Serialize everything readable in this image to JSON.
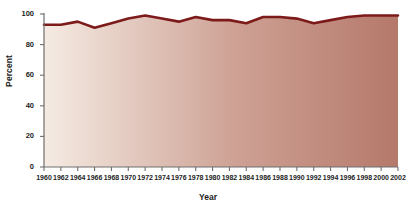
{
  "chart_data": {
    "type": "area",
    "title": "",
    "subtitle": "",
    "xlabel": "Year",
    "ylabel": "Percent",
    "xlim": [
      1960,
      2002
    ],
    "ylim": [
      0,
      100
    ],
    "grid": false,
    "legend": null,
    "annotations": [],
    "yticks": [
      0,
      20,
      40,
      60,
      80,
      100
    ],
    "ytick_labels": [
      "0",
      "20",
      "40",
      "60",
      "80",
      "100"
    ],
    "xticks": [
      1960,
      1962,
      1964,
      1966,
      1968,
      1970,
      1972,
      1974,
      1976,
      1978,
      1980,
      1982,
      1984,
      1986,
      1988,
      1990,
      1992,
      1994,
      1996,
      1998,
      2000,
      2002
    ],
    "xtick_labels": [
      "1960",
      "1962",
      "1964",
      "1966",
      "1968",
      "1970",
      "1972",
      "1974",
      "1976",
      "1978",
      "1980",
      "1982",
      "1984",
      "1986",
      "1988",
      "1990",
      "1992",
      "1994",
      "1996",
      "1998",
      "2000",
      "2002"
    ],
    "x": [
      1960,
      1962,
      1964,
      1966,
      1968,
      1970,
      1972,
      1974,
      1976,
      1978,
      1980,
      1982,
      1984,
      1986,
      1988,
      1990,
      1992,
      1994,
      1996,
      1998,
      2000,
      2002
    ],
    "values": [
      93,
      93,
      95,
      91,
      94,
      97,
      99,
      97,
      95,
      98,
      96,
      96,
      94,
      98,
      98,
      97,
      94,
      96,
      98,
      99,
      99,
      99
    ],
    "series": [
      {
        "name": "Percent",
        "values": [
          93,
          93,
          95,
          91,
          94,
          97,
          99,
          97,
          95,
          98,
          96,
          96,
          94,
          98,
          98,
          97,
          94,
          96,
          98,
          99,
          99,
          99
        ]
      }
    ],
    "colors": {
      "line": "#7d1a1a",
      "fill_start": "#f5ebe3",
      "fill_end": "#b5796b",
      "axis": "#6e6e6e",
      "text": "#232323",
      "background": "#ffffff"
    }
  }
}
